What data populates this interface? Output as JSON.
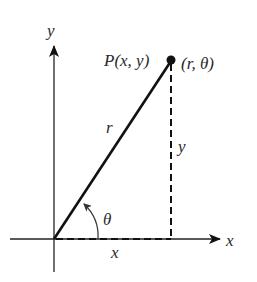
{
  "diagram": {
    "labels": {
      "y_axis": "y",
      "x_axis": "x",
      "point_rect": "P(x, y)",
      "point_polar": "(r, θ)",
      "radius": "r",
      "vertical_leg": "y",
      "horizontal_leg": "x",
      "angle": "θ"
    },
    "colors": {
      "stroke": "#111111",
      "text": "#2a2a2a",
      "background": "#ffffff"
    },
    "geometry": {
      "origin": [
        54,
        239
      ],
      "point": [
        171,
        61
      ]
    }
  }
}
